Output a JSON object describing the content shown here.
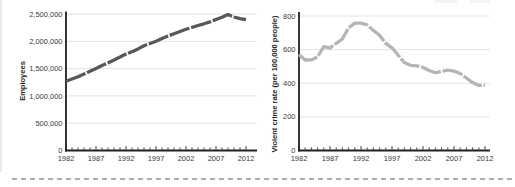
{
  "colors": {
    "left_line": "#57585a",
    "right_line": "#b4b5b7",
    "grid": "#e4e4e4",
    "axis": "#231f20",
    "tick_text": "#3a3a3a",
    "cut_dash": "#aeaeae",
    "page_edge": "#eaeaea"
  },
  "chart_data": [
    {
      "type": "line",
      "title": "",
      "ylabel": "Employees",
      "xlabel": "",
      "ylim": [
        0,
        2500000
      ],
      "grid": true,
      "legend": "none",
      "line_color": "#57585a",
      "x": [
        1982,
        1983,
        1984,
        1985,
        1986,
        1987,
        1988,
        1989,
        1990,
        1991,
        1992,
        1993,
        1994,
        1995,
        1996,
        1997,
        1998,
        1999,
        2000,
        2001,
        2002,
        2003,
        2004,
        2005,
        2006,
        2007,
        2008,
        2009,
        2010,
        2011,
        2012
      ],
      "values": [
        1270000,
        1310000,
        1350000,
        1400000,
        1450000,
        1500000,
        1555000,
        1605000,
        1660000,
        1710000,
        1765000,
        1810000,
        1860000,
        1920000,
        1960000,
        2000000,
        2050000,
        2095000,
        2140000,
        2180000,
        2220000,
        2255000,
        2290000,
        2320000,
        2355000,
        2400000,
        2440000,
        2490000,
        2445000,
        2415000,
        2395000
      ],
      "yticks": [
        {
          "v": 0,
          "label": "0"
        },
        {
          "v": 500000,
          "label": "500,000"
        },
        {
          "v": 1000000,
          "label": "1,000,000"
        },
        {
          "v": 1500000,
          "label": "1,500,000"
        },
        {
          "v": 2000000,
          "label": "2,000,000"
        },
        {
          "v": 2500000,
          "label": "2,500,000"
        }
      ],
      "xticks": [
        {
          "v": 1982,
          "label": "1982"
        },
        {
          "v": 1987,
          "label": "1987"
        },
        {
          "v": 1992,
          "label": "1992"
        },
        {
          "v": 1997,
          "label": "1997"
        },
        {
          "v": 2002,
          "label": "2002"
        },
        {
          "v": 2007,
          "label": "2007"
        },
        {
          "v": 2012,
          "label": "2012"
        }
      ]
    },
    {
      "type": "line",
      "title": "",
      "ylabel": "Violent crime rate (per 100,000 people)",
      "xlabel": "",
      "ylim": [
        0,
        800
      ],
      "grid": true,
      "legend": "none",
      "line_color": "#b4b5b7",
      "x": [
        1982,
        1983,
        1984,
        1985,
        1986,
        1987,
        1988,
        1989,
        1990,
        1991,
        1992,
        1993,
        1994,
        1995,
        1996,
        1997,
        1998,
        1999,
        2000,
        2001,
        2002,
        2003,
        2004,
        2005,
        2006,
        2007,
        2008,
        2009,
        2010,
        2011,
        2012
      ],
      "values": [
        571,
        538,
        539,
        557,
        618,
        610,
        637,
        663,
        730,
        758,
        758,
        747,
        714,
        685,
        637,
        611,
        566,
        523,
        507,
        504,
        494,
        476,
        463,
        469,
        479,
        472,
        458,
        431,
        404,
        387,
        387
      ],
      "yticks": [
        {
          "v": 0,
          "label": "0"
        },
        {
          "v": 200,
          "label": "200"
        },
        {
          "v": 400,
          "label": "400"
        },
        {
          "v": 600,
          "label": "600"
        },
        {
          "v": 800,
          "label": "800"
        }
      ],
      "xticks": [
        {
          "v": 1982,
          "label": "1982"
        },
        {
          "v": 1987,
          "label": "1987"
        },
        {
          "v": 1992,
          "label": "1992"
        },
        {
          "v": 1997,
          "label": "1997"
        },
        {
          "v": 2002,
          "label": "2002"
        },
        {
          "v": 2007,
          "label": "2007"
        },
        {
          "v": 2012,
          "label": "2012"
        }
      ]
    }
  ]
}
